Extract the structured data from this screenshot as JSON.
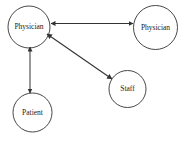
{
  "diagram": {
    "type": "node-link-graph",
    "background_color": "#ffffff",
    "stroke_color": "#333333",
    "text_color": "#1a1a1a",
    "canvas": {
      "width": 190,
      "height": 141
    },
    "nodes": [
      {
        "id": "physician-left",
        "label": "Physician",
        "shape": "circle",
        "cx": 29,
        "cy": 27,
        "r": 21,
        "font_size": 7.5
      },
      {
        "id": "physician-right",
        "label": "Physician",
        "shape": "circle",
        "cx": 155.5,
        "cy": 27.5,
        "r": 22,
        "font_size": 7.5
      },
      {
        "id": "patient",
        "label": "Patient",
        "shape": "circle",
        "cx": 32.5,
        "cy": 112.5,
        "r": 19.5,
        "font_size": 7.5
      },
      {
        "id": "staff",
        "label": "Staff",
        "shape": "circle",
        "cx": 127.5,
        "cy": 89,
        "r": 18.5,
        "font_size": 7.5
      }
    ],
    "edges": [
      {
        "id": "edge-physician-physician",
        "from": "physician-left",
        "to": "physician-right",
        "arrowheads": "both",
        "x1": 51,
        "y1": 23.5,
        "x2": 133,
        "y2": 23.5
      },
      {
        "id": "edge-physician-patient",
        "from": "physician-left",
        "to": "patient",
        "arrowheads": "both",
        "x1": 30,
        "y1": 47,
        "x2": 30,
        "y2": 93
      },
      {
        "id": "edge-physician-staff",
        "from": "physician-left",
        "to": "staff",
        "arrowheads": "both",
        "x1": 47,
        "y1": 34,
        "x2": 112,
        "y2": 79
      }
    ]
  }
}
